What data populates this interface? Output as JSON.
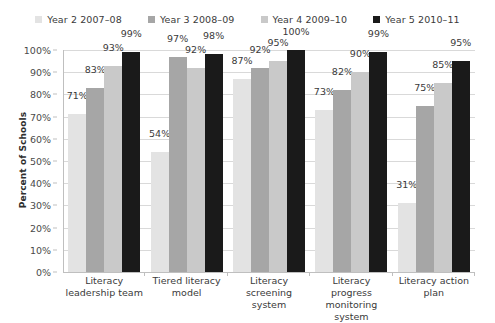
{
  "chart_data": {
    "type": "bar",
    "title": "",
    "xlabel": "",
    "ylabel": "Percent of Schools",
    "ylim": [
      0,
      100
    ],
    "ytick_labels": [
      "100%",
      "90%",
      "80%",
      "70%",
      "60%",
      "50%",
      "40%",
      "30%",
      "20%",
      "10%",
      "0%"
    ],
    "ytick_values": [
      100,
      90,
      80,
      70,
      60,
      50,
      40,
      30,
      20,
      10,
      0
    ],
    "grid": true,
    "legend_position": "top",
    "categories": [
      "Literacy leadership team",
      "Tiered literacy model",
      "Literacy screening system",
      "Literacy progress monitoring system",
      "Literacy action plan"
    ],
    "category_lines": [
      [
        "Literacy",
        "leadership team"
      ],
      [
        "Tiered literacy",
        "model"
      ],
      [
        "Literacy screening",
        "system"
      ],
      [
        "Literacy progress",
        "monitoring system"
      ],
      [
        "Literacy action",
        "plan"
      ]
    ],
    "series": [
      {
        "name": "Year 2 2007–08",
        "color": "#e3e3e3",
        "values": [
          71,
          54,
          87,
          73,
          31
        ],
        "labels": [
          "71%",
          "54%",
          "87%",
          "73%",
          "31%"
        ]
      },
      {
        "name": "Year 3 2008–09",
        "color": "#a6a6a6",
        "values": [
          83,
          97,
          92,
          82,
          75
        ],
        "labels": [
          "83%",
          "97%",
          "92%",
          "82%",
          "75%"
        ]
      },
      {
        "name": "Year 4 2009–10",
        "color": "#c9c9c9",
        "values": [
          93,
          92,
          95,
          90,
          85
        ],
        "labels": [
          "93%",
          "92%",
          "95%",
          "90%",
          "85%"
        ]
      },
      {
        "name": "Year 5 2010–11",
        "color": "#1a1a1a",
        "values": [
          99,
          98,
          100,
          99,
          95
        ],
        "labels": [
          "99%",
          "98%",
          "100%",
          "99%",
          "95%"
        ]
      }
    ]
  }
}
